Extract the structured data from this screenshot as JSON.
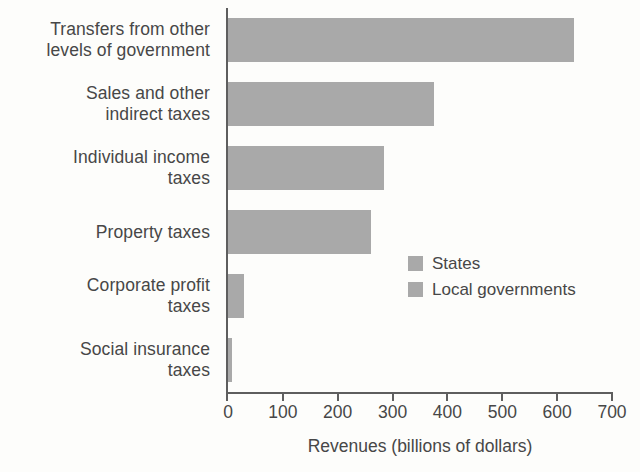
{
  "chart_data": {
    "type": "bar",
    "orientation": "horizontal",
    "title": "",
    "subtitle": "",
    "xlabel": "Revenues (billions of dollars)",
    "ylabel": "",
    "xlim": [
      0,
      700
    ],
    "xticks": [
      0,
      100,
      200,
      300,
      400,
      500,
      600,
      700
    ],
    "xticklabels": [
      "0",
      "100",
      "200",
      "300",
      "400",
      "500",
      "600",
      "700"
    ],
    "grid": false,
    "legend_position": "center-right-inside",
    "bar_color": "#a9a9a9",
    "categories": [
      "Transfers from other levels of government",
      "Sales and other indirect taxes",
      "Individual income taxes",
      "Property taxes",
      "Corporate profit taxes",
      "Social insurance taxes"
    ],
    "category_label_lines": [
      [
        "Transfers from other",
        "levels of government"
      ],
      [
        "Sales and other",
        "indirect taxes"
      ],
      [
        "Individual income",
        "taxes"
      ],
      [
        "Property taxes"
      ],
      [
        "Corporate profit",
        "taxes"
      ],
      [
        "Social insurance",
        "taxes"
      ]
    ],
    "values": [
      630,
      375,
      285,
      260,
      30,
      8
    ],
    "legend": [
      {
        "label": "States",
        "color": "#a9a9a9"
      },
      {
        "label": "Local governments",
        "color": "#a9a9a9"
      }
    ]
  }
}
